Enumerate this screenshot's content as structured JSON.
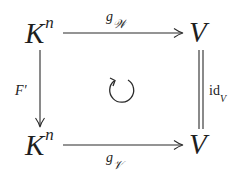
{
  "diagram": {
    "type": "commutative-square",
    "nodes": {
      "top_left": {
        "base": "K",
        "sup": "n"
      },
      "top_right": {
        "base": "V"
      },
      "bottom_left": {
        "base": "K",
        "sup": "n"
      },
      "bottom_right": {
        "base": "V"
      }
    },
    "arrows": {
      "top": {
        "from": "top_left",
        "to": "top_right",
        "label_base": "g",
        "label_sub": "𝒲"
      },
      "bottom": {
        "from": "bottom_left",
        "to": "bottom_right",
        "label_base": "g",
        "label_sub": "𝒱"
      },
      "left": {
        "from": "top_left",
        "to": "bottom_left",
        "label_base": "F",
        "label_prime": "′"
      },
      "right": {
        "from": "top_right",
        "to": "bottom_right",
        "style": "double-line",
        "label_base": "id",
        "label_sub": "V"
      }
    },
    "center_symbol": "circular-arrow-commutes",
    "stroke_color": "#2a2a2a"
  }
}
